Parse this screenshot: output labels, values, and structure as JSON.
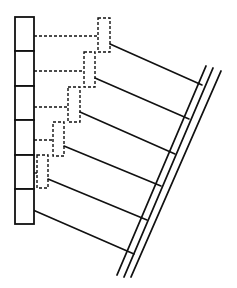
{
  "diagram": {
    "type": "schematic-line-drawing",
    "background": "#ffffff",
    "stroke_color": "#111111",
    "column": {
      "x": 15,
      "width": 19,
      "top": 17,
      "cell_heights": [
        34,
        35,
        34,
        35,
        34,
        35
      ],
      "cell_count": 6
    },
    "dashed_boxes": [
      {
        "x": 98,
        "y": 18,
        "w": 12,
        "h": 34
      },
      {
        "x": 84,
        "y": 52,
        "w": 11,
        "h": 35
      },
      {
        "x": 68,
        "y": 87,
        "w": 12,
        "h": 35
      },
      {
        "x": 53,
        "y": 122,
        "w": 11,
        "h": 34
      },
      {
        "x": 37,
        "y": 155,
        "w": 11,
        "h": 33
      }
    ],
    "dashed_leaders": [
      {
        "x1": 34,
        "y1": 36,
        "x2": 98,
        "y2": 36
      },
      {
        "x1": 34,
        "y1": 71,
        "x2": 84,
        "y2": 71
      },
      {
        "x1": 34,
        "y1": 107,
        "x2": 68,
        "y2": 107
      },
      {
        "x1": 34,
        "y1": 140,
        "x2": 53,
        "y2": 140
      },
      {
        "x1": 34,
        "y1": 173,
        "x2": 37,
        "y2": 173
      }
    ],
    "connectors": [
      {
        "x1": 110,
        "y1": 44,
        "x2": 202,
        "y2": 85
      },
      {
        "x1": 95,
        "y1": 78,
        "x2": 189,
        "y2": 119
      },
      {
        "x1": 80,
        "y1": 112,
        "x2": 175,
        "y2": 154
      },
      {
        "x1": 64,
        "y1": 146,
        "x2": 161,
        "y2": 186
      },
      {
        "x1": 48,
        "y1": 179,
        "x2": 147,
        "y2": 220
      },
      {
        "x1": 33,
        "y1": 210,
        "x2": 134,
        "y2": 254
      }
    ],
    "rails": [
      {
        "x1": 206,
        "y1": 66,
        "x2": 117,
        "y2": 275
      },
      {
        "x1": 213,
        "y1": 68,
        "x2": 124,
        "y2": 277
      },
      {
        "x1": 221,
        "y1": 71,
        "x2": 131,
        "y2": 277
      }
    ]
  }
}
